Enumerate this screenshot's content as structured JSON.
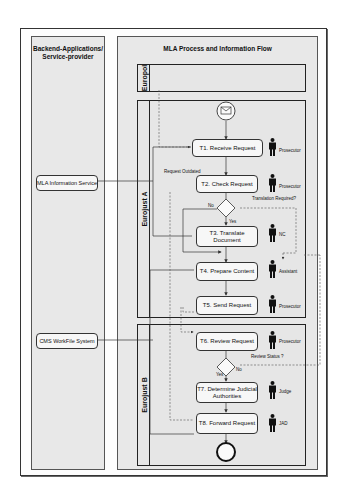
{
  "pools": {
    "left": {
      "title": "Backend-Applications/ Service-provider"
    },
    "right": {
      "title": "MLA Process and Information Flow"
    }
  },
  "lanes": [
    {
      "id": "europol",
      "label": "Europol"
    },
    {
      "id": "eurojust_a",
      "label": "Eurojust  A"
    },
    {
      "id": "eurojust_b",
      "label": "Eurojust  B"
    }
  ],
  "systems": [
    {
      "id": "mla_info",
      "label": "MLA Information Service"
    },
    {
      "id": "cms",
      "label": "CMS WorkFile System"
    }
  ],
  "tasks": [
    {
      "id": "t1",
      "label": "T1. Receive Request",
      "actor": "Prosecutor"
    },
    {
      "id": "t2",
      "label": "T2. Check Request",
      "actor": "Prosecutor"
    },
    {
      "id": "t3",
      "label": "T3. Translate Document",
      "actor": "NC"
    },
    {
      "id": "t4",
      "label": "T4. Prepare Content",
      "actor": "Assistant"
    },
    {
      "id": "t5",
      "label": "T5. Send Request",
      "actor": "Prosecutor"
    },
    {
      "id": "t6",
      "label": "T6. Review Request",
      "actor": "Prosecutor"
    },
    {
      "id": "t7",
      "label": "T7. Determine Judicial Authorities",
      "actor": "Judge"
    },
    {
      "id": "t8",
      "label": "T8. Forward Request",
      "actor": "JAD"
    }
  ],
  "notes": {
    "request_outdated": "Request Outdated",
    "translation_required": "Translation Required?",
    "review_status": "Review Status ?",
    "no": "No",
    "yes": "Yes",
    "no2": "No",
    "yes2": "Yes"
  },
  "events": {
    "start": "envelope-icon",
    "end": "end-event"
  }
}
